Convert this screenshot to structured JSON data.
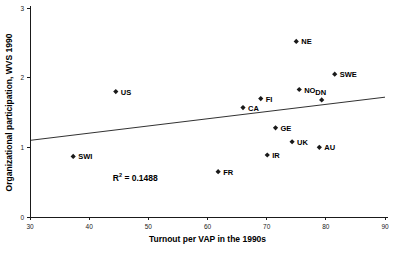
{
  "chart_data": {
    "type": "scatter",
    "title": "",
    "xlabel": "Turnout per VAP in the 1990s",
    "ylabel": "Organizational participation, WVS 1990",
    "xlim": [
      30,
      90
    ],
    "ylim": [
      0,
      3
    ],
    "xticks": [
      "30",
      "40",
      "50",
      "60",
      "70",
      "80",
      "90"
    ],
    "yticks": [
      "0",
      "1",
      "2",
      "3"
    ],
    "grid": false,
    "legend": "none",
    "annotations": [
      {
        "name": "r-squared",
        "text": "R",
        "sup": "2",
        "rest": " = 0.1488",
        "full": "R2 = 0.1488",
        "x": 44,
        "y": 0.52
      }
    ],
    "trendline": {
      "name": "linear-fit",
      "x0": 30,
      "y0": 1.1,
      "x1": 90,
      "y1": 1.72
    },
    "points": [
      {
        "label": "US",
        "x": 44.5,
        "y": 1.8,
        "label_pos": "right"
      },
      {
        "label": "SWI",
        "x": 37.3,
        "y": 0.87,
        "label_pos": "right"
      },
      {
        "label": "FR",
        "x": 61.8,
        "y": 0.65,
        "label_pos": "right"
      },
      {
        "label": "CA",
        "x": 66.0,
        "y": 1.57,
        "label_pos": "right"
      },
      {
        "label": "FI",
        "x": 69.0,
        "y": 1.7,
        "label_pos": "right"
      },
      {
        "label": "IR",
        "x": 70.1,
        "y": 0.89,
        "label_pos": "right"
      },
      {
        "label": "GE",
        "x": 71.5,
        "y": 1.28,
        "label_pos": "right"
      },
      {
        "label": "UK",
        "x": 74.3,
        "y": 1.08,
        "label_pos": "right"
      },
      {
        "label": "NE",
        "x": 75.0,
        "y": 2.52,
        "label_pos": "right"
      },
      {
        "label": "NO",
        "x": 75.5,
        "y": 1.83,
        "label_pos": "right"
      },
      {
        "label": "AU",
        "x": 78.9,
        "y": 1.0,
        "label_pos": "right"
      },
      {
        "label": "DN",
        "x": 79.3,
        "y": 1.68,
        "label_pos": "above"
      },
      {
        "label": "SWE",
        "x": 81.5,
        "y": 2.05,
        "label_pos": "right"
      }
    ]
  },
  "colors": {
    "marker": "#1a1a1a",
    "axis": "#1a1a1a",
    "trendline": "#1a1a1a",
    "background": "#ffffff"
  }
}
